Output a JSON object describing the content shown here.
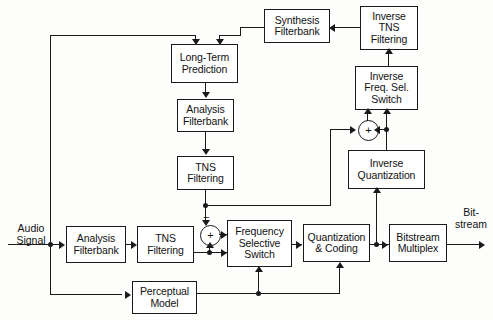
{
  "diagram": {
    "line_color": "#1a1a1a",
    "background_color": "#fdfdfc"
  },
  "blocks": {
    "long_term_prediction": "Long-Term\nPrediction",
    "analysis_filterbank_ltp": "Analysis\nFilterbank",
    "tns_filtering_ltp": "TNS\nFiltering",
    "synthesis_filterbank": "Synthesis\nFilterbank",
    "inverse_tns_filtering": "Inverse\nTNS\nFiltering",
    "inverse_freq_sel_switch": "Inverse\nFreq. Sel.\nSwitch",
    "inverse_quantization": "Inverse\nQuantization",
    "analysis_filterbank_main": "Analysis\nFilterbank",
    "tns_filtering_main": "TNS\nFiltering",
    "frequency_selective_switch": "Frequency\nSelective\nSwitch",
    "quantization_and_coding": "Quantization\n& Coding",
    "bitstream_multiplex": "Bitstream\nMultiplex",
    "perceptual_model": "Perceptual\nModel"
  },
  "labels": {
    "audio_signal": "Audio\nSignal",
    "bitstream": "Bit-\nstream",
    "sum_symbol": "+",
    "minus_symbol": "−"
  }
}
